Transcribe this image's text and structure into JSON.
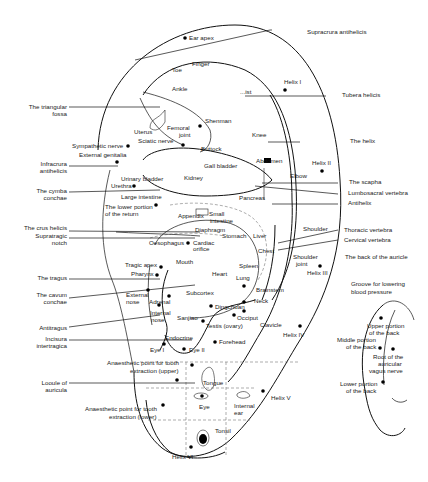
{
  "diagram": {
    "left_labels": {
      "triangular_fossa_1": "The triangular",
      "triangular_fossa_2": "fossa",
      "infracrura_1": "Infracrura",
      "infracrura_2": "antihelicis",
      "cymba_1": "The cymba",
      "cymba_2": "conchae",
      "crus_helicis": "The crus helicis",
      "supratragic_1": "Supratragic",
      "supratragic_2": "notch",
      "tragus": "The tragus",
      "cavum_1": "The cavum",
      "cavum_2": "conchae",
      "antitragus": "Antitragus",
      "incisura_1": "Incisura",
      "incisura_2": "intertragica",
      "lobule_1": "Looule of",
      "lobule_2": "auricula"
    },
    "right_labels": {
      "supracrura": "Supracrura antihelicis",
      "tubera": "Tubera helicis",
      "helix": "The helix",
      "scapha": "The scapha",
      "lumbosacral": "Lumbosacral vertebra",
      "antihelix": "Antihelix",
      "thoracic": "Thoracic vertebra",
      "cervical": "Cervical vertebra"
    },
    "points": {
      "ear_apex": "Ear apex",
      "finger": "Finger",
      "toe": "Toe",
      "ankle": "Ankle",
      "wrist": "...ist",
      "helix_1": "Helix I",
      "helix_2": "Helix II",
      "helix_3": "Helix III",
      "helix_4": "Helix IV",
      "helix_5": "Helix V",
      "helix_6": "Helix VI",
      "shenman": "Shenman",
      "uterus": "Uterus",
      "femoral_1": "Femoral",
      "femoral_2": "joint",
      "sympathetic": "Sympathetic nerve",
      "sciatic": "Sciatic nerve",
      "buttock": "Buttock",
      "knee": "Knee",
      "external_genitalia": "External genitalia",
      "abdomen": "Abdomen",
      "elbow": "Elbow",
      "gall_bladder": "Gall bladder",
      "kidney": "Kidney",
      "urinary_bladder": "Urinary bladder",
      "urethra": "Urethra",
      "large_intestine": "Large intestine",
      "pancreas": "Pancreas",
      "lower_rectum_1": "The lower portion",
      "lower_rectum_2": "of the return",
      "appendix": "Appendix",
      "small_intestine_1": "Small",
      "small_intestine_2": "intestine",
      "diaphragm": "Diaphragm",
      "stomach": "Stomach",
      "liver": "Liver",
      "shoulder": "Shoulder",
      "oesophagus": "Oesophagus",
      "cardiac_1": "Cardiac",
      "cardiac_2": "orifice",
      "chest": "Chest",
      "mouth": "Mouth",
      "tragic_apex": "Tragic apex",
      "pharynx": "Pharynx",
      "spleen": "Spleen",
      "shoulder_joint_1": "Shoulder",
      "shoulder_joint_2": "joint",
      "heart": "Heart",
      "lung": "Lung",
      "external_nose_1": "External",
      "external_nose_2": "nose",
      "adrenal": "Adrenal",
      "subcortex": "Subcortex",
      "brainstem": "Brainstem",
      "neck": "Neck",
      "internal_nose_1": "Internal",
      "internal_nose_2": "nose",
      "sanjiao": "Sanjiao",
      "dingchuan": "Dingchuan",
      "occiput": "Occiput",
      "clavicle": "Clavicle",
      "testis": "Testis (ovary)",
      "endocrine": "Endocrine",
      "forehead": "Forehead",
      "eye_1": "Eye I",
      "eye_2": "Eye II",
      "anaesthetic_upper_1": "Anaesthetic point for tooth",
      "anaesthetic_upper_2": "extraction (upper)",
      "tongue": "Tongue",
      "eye": "Eye",
      "internal_ear_1": "Internal",
      "internal_ear_2": "ear",
      "anaesthetic_lower_1": "Anaesthetic point for tooth",
      "anaesthetic_lower_2": "extraction (lower)",
      "tonsil": "Tonsil"
    },
    "back_of_auricle": {
      "title": "The back of the auricle",
      "groove_1": "Groove for lowering",
      "groove_2": "blood pressure",
      "upper_1": "Upper portion",
      "upper_2": "of the back",
      "middle_1": "Middle portion",
      "middle_2": "of the back",
      "root_1": "Root of the",
      "root_2": "auricular",
      "root_3": "vagus nerve",
      "lower_1": "Lower portion",
      "lower_2": "of the back"
    }
  }
}
